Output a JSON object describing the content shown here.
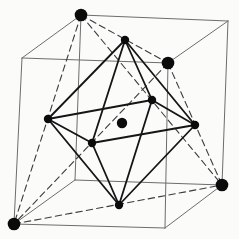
{
  "figure": {
    "name": "fcc-unit-cell-with-octahedral-interstitial-atom",
    "canvas": {
      "width": 239,
      "height": 239,
      "background": "#fbfbf9"
    },
    "styles": {
      "cube_edge": {
        "color": "#6d6d6d",
        "width": 1.0
      },
      "face_diagonal": {
        "color": "#3c3c3c",
        "width": 1.1,
        "dash": "6.5 4"
      },
      "octahedron_edge": {
        "color": "#151515",
        "width": 1.8
      },
      "atom_color": "#0b0b0b"
    },
    "nodes": {
      "FBL": [
        14,
        224
      ],
      "FBR": [
        165,
        228
      ],
      "FTL": [
        22,
        58
      ],
      "FTR": [
        168,
        63
      ],
      "BBL": [
        75,
        180
      ],
      "BBR": [
        222,
        185
      ],
      "BTL": [
        81,
        15
      ],
      "BTR": [
        228,
        21
      ],
      "face_top": [
        125,
        40
      ],
      "face_bottom": [
        119,
        205
      ],
      "face_left": [
        48,
        119
      ],
      "face_right": [
        195,
        125
      ],
      "face_front": [
        92,
        143
      ],
      "face_back": [
        152,
        100
      ],
      "body_center": [
        122,
        123
      ]
    },
    "cube_edges": [
      [
        "BTL",
        "BTR"
      ],
      [
        "BTL",
        "FTL"
      ],
      [
        "FTL",
        "FTR"
      ],
      [
        "FTR",
        "BTR"
      ],
      [
        "FTL",
        "FBL"
      ],
      [
        "FTR",
        "FBR"
      ],
      [
        "BTR",
        "BBR"
      ],
      [
        "BTL",
        "BBL"
      ],
      [
        "FBL",
        "FBR"
      ],
      [
        "FBR",
        "BBR"
      ],
      [
        "BBL",
        "BBR"
      ],
      [
        "FBL",
        "BBL"
      ]
    ],
    "face_diagonals": [
      [
        "BTL",
        "FTR"
      ],
      [
        "BTL",
        "FBL"
      ],
      [
        "BTL",
        "BBR"
      ],
      [
        "FTR",
        "FBL"
      ],
      [
        "FTR",
        "BBR"
      ],
      [
        "FBL",
        "BBR"
      ]
    ],
    "octahedron_edges": [
      [
        "face_top",
        "face_left"
      ],
      [
        "face_top",
        "face_right"
      ],
      [
        "face_top",
        "face_front"
      ],
      [
        "face_top",
        "face_back"
      ],
      [
        "face_bottom",
        "face_left"
      ],
      [
        "face_bottom",
        "face_right"
      ],
      [
        "face_bottom",
        "face_front"
      ],
      [
        "face_bottom",
        "face_back"
      ],
      [
        "face_left",
        "face_front"
      ],
      [
        "face_front",
        "face_right"
      ],
      [
        "face_right",
        "face_back"
      ],
      [
        "face_back",
        "face_left"
      ]
    ],
    "atoms": [
      {
        "kind": "corner-atom",
        "radius": 6.3,
        "at": [
          "BTL",
          "FTR",
          "BBR",
          "FBL"
        ]
      },
      {
        "kind": "face-center-atom",
        "radius": 4.2,
        "at": [
          "face_top",
          "face_bottom",
          "face_left",
          "face_right",
          "face_front",
          "face_back"
        ]
      },
      {
        "kind": "interstitial-atom",
        "radius": 5.2,
        "at": [
          "body_center"
        ]
      }
    ]
  }
}
